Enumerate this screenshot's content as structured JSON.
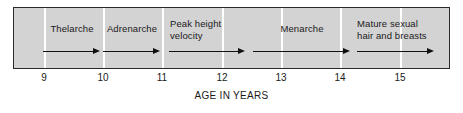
{
  "figure": {
    "background_color": "#ffffff",
    "panel_color": "#d3d3d3",
    "panel_border_color": "#2b2b2b",
    "gridline_color": "#ffffff",
    "arrow_color": "#111111",
    "text_color": "#1a1a1a"
  },
  "chart_data": {
    "type": "bar",
    "title": "",
    "subtitle": "",
    "xlabel": "AGE IN YEARS",
    "ylabel": "",
    "xlim": [
      8.25,
      15.75
    ],
    "grid": true,
    "legend": "none",
    "tick_labels": [
      "9",
      "10",
      "11",
      "12",
      "13",
      "14",
      "15"
    ],
    "tick_values": [
      9,
      10,
      11,
      12,
      13,
      14,
      15
    ],
    "categories": [
      "Thelarche",
      "Adrenarche",
      "Peak height velocity",
      "Menarche",
      "Mature sexual hair and breasts"
    ],
    "series": [
      {
        "name": "Pubertal event duration (years)",
        "values": [
          0.95,
          0.95,
          1.27,
          1.63,
          1.29
        ]
      }
    ],
    "events": [
      {
        "label": "Thelarche",
        "label_lines": [
          "Thelarche"
        ],
        "label_align": "center",
        "start_age": 8.8,
        "end_age": 9.75,
        "arrow_start_px": 42,
        "arrow_end_px": 99,
        "label_left_px": 40,
        "label_width_px": 62,
        "label_top_px": 22,
        "arrow_top_px": 47
      },
      {
        "label": "Adrenarche",
        "label_lines": [
          "Adrenarche"
        ],
        "label_align": "center",
        "start_age": 9.78,
        "end_age": 10.73,
        "arrow_start_px": 102,
        "arrow_end_px": 159,
        "label_left_px": 98,
        "label_width_px": 66,
        "label_top_px": 22,
        "arrow_top_px": 47
      },
      {
        "label": "Peak height velocity",
        "label_lines": [
          "Peak height",
          "velocity"
        ],
        "label_align": "left",
        "start_age": 10.88,
        "end_age": 12.15,
        "arrow_start_px": 168,
        "arrow_end_px": 244,
        "label_left_px": 169,
        "label_width_px": 70,
        "label_top_px": 17,
        "arrow_top_px": 47
      },
      {
        "label": "Menarche",
        "label_lines": [
          "Menarche"
        ],
        "label_align": "center",
        "start_age": 12.28,
        "end_age": 13.91,
        "arrow_start_px": 252,
        "arrow_end_px": 349,
        "label_left_px": 265,
        "label_width_px": 72,
        "label_top_px": 22,
        "arrow_top_px": 47
      },
      {
        "label": "Mature sexual hair and breasts",
        "label_lines": [
          "Mature sexual",
          "hair and breasts"
        ],
        "label_align": "left",
        "start_age": 14.04,
        "end_age": 15.33,
        "arrow_start_px": 356,
        "arrow_end_px": 433,
        "label_left_px": 356,
        "label_width_px": 92,
        "label_top_px": 17,
        "arrow_top_px": 47
      }
    ],
    "tick_positions_px": [
      44,
      103,
      162,
      222,
      281,
      340,
      400
    ]
  }
}
